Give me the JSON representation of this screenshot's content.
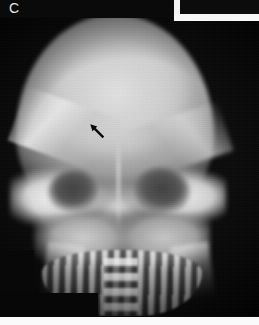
{
  "figure": {
    "panel_label": "C",
    "modality": "radiograph",
    "view": "skull-anteroposterior",
    "width_px": 259,
    "height_px": 325
  },
  "annotations": {
    "arrow": {
      "name": "lesion-arrow",
      "direction": "up-left",
      "angle_deg": 45,
      "color": "#0a0a0a",
      "x_px": 86,
      "y_px": 120
    }
  },
  "anatomy": {
    "regions": [
      {
        "name": "cranial-vault",
        "label": "Cranial vault"
      },
      {
        "name": "frontal-bone",
        "label": "Frontal bone"
      },
      {
        "name": "orbit-left",
        "label": "Left orbit"
      },
      {
        "name": "orbit-right",
        "label": "Right orbit"
      },
      {
        "name": "petrous-ridge",
        "label": "Petrous ridge"
      },
      {
        "name": "facial-mass",
        "label": "Maxillofacial mass"
      },
      {
        "name": "dental-arch",
        "label": "Dental arch"
      },
      {
        "name": "cervical-column",
        "label": "Cervical column"
      },
      {
        "name": "mandible-ramus-left",
        "label": "Left mandibular ramus"
      },
      {
        "name": "mandible-ramus-right",
        "label": "Right mandibular ramus"
      }
    ]
  },
  "film_artifacts": {
    "frame_corner": {
      "name": "film-frame-corner",
      "position": "top-right",
      "color": "#f7f7f7"
    },
    "notch": {
      "name": "film-notch",
      "position": "bottom-left",
      "color": "#070707"
    },
    "bottom_strip": {
      "name": "film-edge-strip",
      "position": "bottom",
      "color": "#fafafa"
    }
  },
  "palette": {
    "background": "#050505",
    "bone_bright": "#e2e2e2",
    "bone_mid": "#a8a8a8",
    "soft_tissue": "#3f3f3f",
    "film_white": "#fafafa"
  }
}
